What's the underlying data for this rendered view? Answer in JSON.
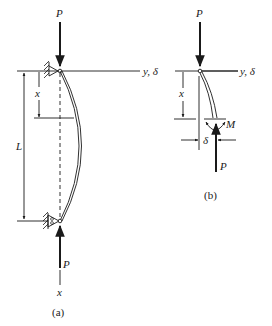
{
  "figure": {
    "part_a": {
      "caption": "(a)",
      "load_top_label": "P",
      "load_bottom_label": "P",
      "axis_y_label": "y, δ",
      "axis_x_label": "x",
      "length_label": "L",
      "position_label": "x",
      "supports": [
        "pinned-top",
        "pinned-bottom"
      ]
    },
    "part_b": {
      "caption": "(b)",
      "load_top_label": "P",
      "load_bottom_label": "P",
      "axis_y_label": "y, δ",
      "position_label": "x",
      "moment_label": "M",
      "deflection_label": "δ"
    }
  }
}
